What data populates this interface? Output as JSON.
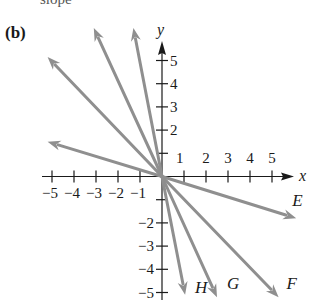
{
  "header": {
    "cut_text": "slope",
    "panel_label": "(b)"
  },
  "axes": {
    "x_label": "x",
    "y_label": "y",
    "x_range": [
      -5,
      5
    ],
    "y_range": [
      -5,
      5
    ],
    "x_ticks": [
      {
        "value": -5,
        "label": "−5"
      },
      {
        "value": -4,
        "label": "−4"
      },
      {
        "value": -3,
        "label": "−3"
      },
      {
        "value": -2,
        "label": "−2"
      },
      {
        "value": -1,
        "label": "−1"
      },
      {
        "value": 1,
        "label": "1"
      },
      {
        "value": 2,
        "label": "2"
      },
      {
        "value": 3,
        "label": "3"
      },
      {
        "value": 4,
        "label": "4"
      },
      {
        "value": 5,
        "label": "5"
      }
    ],
    "y_ticks": [
      {
        "value": 5,
        "label": "5"
      },
      {
        "value": 4,
        "label": "4"
      },
      {
        "value": 3,
        "label": "3"
      },
      {
        "value": 2,
        "label": "2"
      },
      {
        "value": 1,
        "label": ""
      },
      {
        "value": -1,
        "label": ""
      },
      {
        "value": -2,
        "label": "−2"
      },
      {
        "value": -3,
        "label": "−3"
      },
      {
        "value": -4,
        "label": "−4"
      },
      {
        "value": -5,
        "label": "−5"
      }
    ]
  },
  "vectors": [
    {
      "name": "unlabeled-1",
      "label": "",
      "tip": [
        -5.2,
        1.5
      ]
    },
    {
      "name": "unlabeled-2",
      "label": "",
      "tip": [
        -5.2,
        5.15
      ]
    },
    {
      "name": "unlabeled-3",
      "label": "",
      "tip": [
        -3.1,
        6.4
      ]
    },
    {
      "name": "unlabeled-4",
      "label": "",
      "tip": [
        -1.3,
        6.4
      ]
    },
    {
      "name": "E",
      "label": "E",
      "tip": [
        6.1,
        -1.8
      ]
    },
    {
      "name": "F",
      "label": "F",
      "tip": [
        5.3,
        -5.2
      ]
    },
    {
      "name": "G",
      "label": "G",
      "tip": [
        2.5,
        -5.2
      ]
    },
    {
      "name": "H",
      "label": "H",
      "tip": [
        1.05,
        -5.1
      ]
    }
  ],
  "colors": {
    "vector": "#8f8f8f",
    "axis": "#1a1a1a"
  }
}
